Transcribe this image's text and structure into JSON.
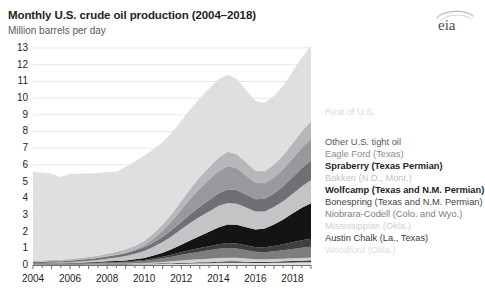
{
  "header": {
    "title": "Monthly U.S. crude oil production (2004–2018)",
    "subtitle": "Million barrels per day",
    "logo": "eia-logo"
  },
  "footnote": "",
  "legend": {
    "position": "right",
    "entries": [
      {
        "label": "Rest of U.S.",
        "color": "#d9d9d9",
        "bold": false,
        "y": 108
      },
      {
        "label": "Other U.S. tight oil",
        "color": "#58595b",
        "bold": false,
        "y": 138
      },
      {
        "label": "Eagle Ford (Texas)",
        "color": "#8a8c8e",
        "bold": false,
        "y": 150
      },
      {
        "label": "Spraberry (Texas Permian)",
        "color": "#231f20",
        "bold": true,
        "y": 162
      },
      {
        "label": "Bakken (N.D., Mont.)",
        "color": "#c2c4c6",
        "bold": false,
        "y": 174
      },
      {
        "label": "Wolfcamp (Texas and N.M. Permian)",
        "color": "#231f20",
        "bold": true,
        "y": 186
      },
      {
        "label": "Bonespring (Texas and N.M. Permian)",
        "color": "#3f3f41",
        "bold": false,
        "y": 198
      },
      {
        "label": "Niobrara-Codell (Colo. and Wyo.)",
        "color": "#7c7e80",
        "bold": false,
        "y": 210
      },
      {
        "label": "Mississippian (Okla.)",
        "color": "#cfd1d3",
        "bold": false,
        "y": 222
      },
      {
        "label": "Austin Chalk (La., Texas)",
        "color": "#3a3a3c",
        "bold": false,
        "y": 234
      },
      {
        "label": "Woodford (Okla.)",
        "color": "#dcdedf",
        "bold": false,
        "y": 246
      }
    ]
  },
  "chart_data": {
    "type": "area",
    "stacked": true,
    "title": "Monthly U.S. crude oil production (2004–2018)",
    "xlabel": "",
    "ylabel": "Million barrels per day",
    "ylim": [
      0,
      13
    ],
    "ytick_values": [
      0,
      1,
      2,
      3,
      4,
      5,
      6,
      7,
      8,
      9,
      10,
      11,
      12,
      13
    ],
    "ytick_labels": [
      "0",
      "1",
      "2",
      "3",
      "4",
      "5",
      "6",
      "7",
      "8",
      "9",
      "10",
      "11",
      "12",
      "13"
    ],
    "xlim": [
      2004,
      2019
    ],
    "xtick_values": [
      2004,
      2006,
      2008,
      2010,
      2012,
      2014,
      2016,
      2018
    ],
    "xtick_labels": [
      "2004",
      "2006",
      "2008",
      "2010",
      "2012",
      "2014",
      "2016",
      "2018"
    ],
    "grid": true,
    "grid_axis": "y",
    "x": [
      2004.0,
      2004.5,
      2005.0,
      2005.5,
      2006.0,
      2006.5,
      2007.0,
      2007.5,
      2008.0,
      2008.5,
      2009.0,
      2009.5,
      2010.0,
      2010.5,
      2011.0,
      2011.5,
      2012.0,
      2012.5,
      2013.0,
      2013.5,
      2014.0,
      2014.5,
      2015.0,
      2015.5,
      2016.0,
      2016.5,
      2017.0,
      2017.5,
      2018.0,
      2018.5,
      2019.0
    ],
    "series_stack_order_bottom_to_top": [
      "Woodford (Okla.)",
      "Austin Chalk (La., Texas)",
      "Mississippian (Okla.)",
      "Niobrara-Codell (Colo. and Wyo.)",
      "Bonespring (Texas and N.M. Permian)",
      "Wolfcamp (Texas and N.M. Permian)",
      "Bakken (N.D., Mont.)",
      "Spraberry (Texas Permian)",
      "Eagle Ford (Texas)",
      "Other U.S. tight oil",
      "Rest of U.S."
    ],
    "series": [
      {
        "name": "Woodford (Okla.)",
        "color": "#dcdedf",
        "values": [
          0.0,
          0.0,
          0.01,
          0.01,
          0.01,
          0.01,
          0.02,
          0.02,
          0.03,
          0.03,
          0.03,
          0.04,
          0.04,
          0.05,
          0.06,
          0.07,
          0.08,
          0.09,
          0.1,
          0.11,
          0.13,
          0.14,
          0.14,
          0.13,
          0.12,
          0.12,
          0.13,
          0.14,
          0.15,
          0.16,
          0.17
        ]
      },
      {
        "name": "Austin Chalk (La., Texas)",
        "color": "#3a3a3c",
        "values": [
          0.03,
          0.03,
          0.03,
          0.03,
          0.03,
          0.03,
          0.03,
          0.03,
          0.03,
          0.03,
          0.03,
          0.03,
          0.03,
          0.04,
          0.04,
          0.04,
          0.05,
          0.05,
          0.06,
          0.06,
          0.07,
          0.08,
          0.08,
          0.07,
          0.06,
          0.06,
          0.07,
          0.08,
          0.09,
          0.1,
          0.11
        ]
      },
      {
        "name": "Mississippian (Okla.)",
        "color": "#cfd1d3",
        "values": [
          0.01,
          0.01,
          0.01,
          0.01,
          0.01,
          0.01,
          0.01,
          0.02,
          0.02,
          0.02,
          0.02,
          0.03,
          0.04,
          0.06,
          0.08,
          0.11,
          0.14,
          0.17,
          0.19,
          0.21,
          0.22,
          0.22,
          0.21,
          0.19,
          0.17,
          0.16,
          0.16,
          0.16,
          0.16,
          0.16,
          0.16
        ]
      },
      {
        "name": "Niobrara-Codell (Colo. and Wyo.)",
        "color": "#7c7e80",
        "values": [
          0.03,
          0.03,
          0.03,
          0.03,
          0.04,
          0.04,
          0.05,
          0.05,
          0.06,
          0.07,
          0.08,
          0.1,
          0.13,
          0.17,
          0.22,
          0.28,
          0.34,
          0.4,
          0.45,
          0.5,
          0.55,
          0.58,
          0.56,
          0.5,
          0.44,
          0.43,
          0.46,
          0.5,
          0.56,
          0.62,
          0.66
        ]
      },
      {
        "name": "Bonespring (Texas and N.M. Permian)",
        "color": "#3f3f41",
        "values": [
          0.01,
          0.01,
          0.01,
          0.01,
          0.01,
          0.02,
          0.02,
          0.02,
          0.03,
          0.03,
          0.04,
          0.05,
          0.06,
          0.08,
          0.1,
          0.13,
          0.16,
          0.19,
          0.22,
          0.25,
          0.28,
          0.3,
          0.3,
          0.29,
          0.28,
          0.29,
          0.32,
          0.36,
          0.4,
          0.44,
          0.48
        ]
      },
      {
        "name": "Wolfcamp (Texas and N.M. Permian)",
        "color": "#141414",
        "values": [
          0.02,
          0.02,
          0.02,
          0.02,
          0.02,
          0.03,
          0.03,
          0.04,
          0.05,
          0.06,
          0.07,
          0.09,
          0.12,
          0.17,
          0.24,
          0.33,
          0.45,
          0.58,
          0.72,
          0.86,
          1.0,
          1.1,
          1.12,
          1.08,
          1.05,
          1.12,
          1.28,
          1.48,
          1.72,
          1.95,
          2.12
        ]
      },
      {
        "name": "Bakken (N.D., Mont.)",
        "color": "#c2c4c6",
        "values": [
          0.02,
          0.02,
          0.03,
          0.04,
          0.05,
          0.07,
          0.09,
          0.12,
          0.16,
          0.21,
          0.27,
          0.34,
          0.42,
          0.52,
          0.64,
          0.78,
          0.92,
          1.05,
          1.15,
          1.22,
          1.28,
          1.3,
          1.26,
          1.18,
          1.08,
          1.03,
          1.05,
          1.1,
          1.18,
          1.28,
          1.38
        ]
      },
      {
        "name": "Spraberry (Texas Permian)",
        "color": "#6e7073",
        "values": [
          0.07,
          0.07,
          0.08,
          0.08,
          0.09,
          0.1,
          0.11,
          0.12,
          0.13,
          0.15,
          0.17,
          0.19,
          0.22,
          0.26,
          0.31,
          0.37,
          0.44,
          0.52,
          0.6,
          0.68,
          0.76,
          0.82,
          0.82,
          0.78,
          0.74,
          0.76,
          0.82,
          0.9,
          1.0,
          1.1,
          1.18
        ]
      },
      {
        "name": "Eagle Ford (Texas)",
        "color": "#98999c",
        "values": [
          0.0,
          0.0,
          0.0,
          0.0,
          0.0,
          0.0,
          0.0,
          0.01,
          0.01,
          0.02,
          0.03,
          0.06,
          0.12,
          0.22,
          0.36,
          0.54,
          0.74,
          0.94,
          1.1,
          1.22,
          1.32,
          1.38,
          1.3,
          1.14,
          0.98,
          0.92,
          0.95,
          1.02,
          1.12,
          1.22,
          1.3
        ]
      },
      {
        "name": "Other U.S. tight oil",
        "color": "#b5b7b9",
        "values": [
          0.08,
          0.08,
          0.09,
          0.09,
          0.1,
          0.11,
          0.12,
          0.13,
          0.15,
          0.17,
          0.19,
          0.22,
          0.26,
          0.31,
          0.37,
          0.44,
          0.52,
          0.6,
          0.68,
          0.75,
          0.82,
          0.86,
          0.84,
          0.78,
          0.72,
          0.72,
          0.76,
          0.82,
          0.9,
          0.98,
          1.05
        ]
      },
      {
        "name": "Rest of U.S.",
        "color": "#dddfe0",
        "values": [
          5.3,
          5.25,
          5.15,
          4.95,
          5.1,
          5.05,
          5.0,
          4.95,
          4.9,
          4.8,
          4.95,
          5.05,
          5.1,
          5.05,
          4.95,
          4.85,
          4.8,
          4.75,
          4.72,
          4.7,
          4.68,
          4.62,
          4.5,
          4.35,
          4.18,
          4.1,
          4.12,
          4.18,
          4.28,
          4.4,
          4.52
        ]
      }
    ],
    "annotations": []
  }
}
